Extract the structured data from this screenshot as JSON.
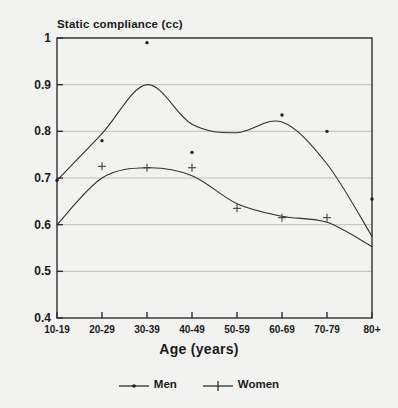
{
  "chart_data": {
    "type": "line",
    "title": "Static compliance (cc)",
    "xlabel": "Age (years)",
    "ylabel": "Static compliance (cc)",
    "categories": [
      "10-19",
      "20-29",
      "30-39",
      "40-49",
      "50-59",
      "60-69",
      "70-79",
      "80+"
    ],
    "ylim": [
      0.4,
      1.0
    ],
    "yticks": [
      "0.4",
      "0.5",
      "0.6",
      "0.7",
      "0.8",
      "0.9",
      "1"
    ],
    "ytick_values": [
      0.4,
      0.5,
      0.6,
      0.7,
      0.8,
      0.9,
      1.0
    ],
    "grid": true,
    "legend_position": "bottom",
    "series": [
      {
        "name": "Men",
        "marker": "dot",
        "values": [
          0.695,
          0.78,
          0.99,
          0.755,
          null,
          0.835,
          0.8,
          0.655
        ],
        "curve": [
          0.695,
          0.795,
          0.9,
          0.815,
          0.797,
          0.82,
          0.73,
          0.575
        ]
      },
      {
        "name": "Women",
        "marker": "plus",
        "values": [
          null,
          0.725,
          0.722,
          0.722,
          0.635,
          0.615,
          0.615,
          null
        ],
        "curve": [
          0.6,
          0.7,
          0.722,
          0.705,
          0.645,
          0.618,
          0.605,
          0.553
        ]
      }
    ]
  },
  "legend": {
    "entries": [
      {
        "label": "Men",
        "marker": "dot-marker-icon"
      },
      {
        "label": "Women",
        "marker": "plus-marker-icon"
      }
    ]
  }
}
